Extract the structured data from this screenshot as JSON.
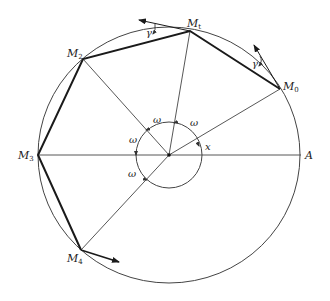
{
  "diagram": {
    "type": "geometry-figure",
    "colors": {
      "stroke": "#333333",
      "thick_stroke": "#1a1a1a",
      "background": "#ffffff"
    },
    "center": {
      "x": 169,
      "y": 155
    },
    "big_circle": {
      "rx": 131,
      "ry": 128
    },
    "small_circle": {
      "r": 33
    },
    "points": [
      {
        "id": "M0",
        "label": "M",
        "sub": "0",
        "x": 280,
        "y": 89
      },
      {
        "id": "M1",
        "label": "M",
        "sub": "1",
        "x": 190,
        "y": 31
      },
      {
        "id": "M2",
        "label": "M",
        "sub": "2",
        "x": 83,
        "y": 59
      },
      {
        "id": "M3",
        "label": "M",
        "sub": "3",
        "x": 38,
        "y": 155
      },
      {
        "id": "M4",
        "label": "M",
        "sub": "4",
        "x": 81,
        "y": 250
      },
      {
        "id": "A",
        "label": "A",
        "sub": "",
        "x": 301,
        "y": 155
      }
    ],
    "labels": {
      "M0": "M",
      "M0_sub": "0",
      "M1": "M",
      "M1_sub": "t",
      "M2": "M",
      "M2_sub": "2",
      "M3": "M",
      "M3_sub": "3",
      "M4": "M",
      "M4_sub": "4",
      "A": "A",
      "omega": "ω",
      "x": "x",
      "gamma": "γ"
    },
    "angle_labels": [
      {
        "text": "ω",
        "x": 152,
        "y": 121
      },
      {
        "text": "ω",
        "x": 192,
        "y": 124
      },
      {
        "text": "ω",
        "x": 133,
        "y": 141
      },
      {
        "text": "ω",
        "x": 131,
        "y": 175
      },
      {
        "text": "x",
        "x": 206,
        "y": 148
      }
    ],
    "arrows": [
      {
        "from": "M1",
        "to": {
          "x": 138,
          "y": 20
        }
      },
      {
        "from": "M0",
        "to": {
          "x": 253,
          "y": 44
        }
      },
      {
        "from": "M4",
        "to": {
          "x": 119,
          "y": 262
        }
      }
    ]
  }
}
